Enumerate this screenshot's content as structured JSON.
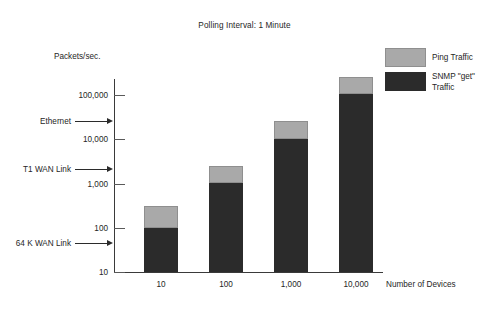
{
  "chart_data": {
    "type": "bar",
    "subtype": "stacked-bar",
    "title": "Polling Interval: 1 Minute",
    "xlabel": "Number of\nDevices",
    "ylabel": "Packets/sec.",
    "categories": [
      "10",
      "100",
      "1,000",
      "10,000"
    ],
    "yscale": "log",
    "ylim": [
      10,
      400000
    ],
    "ytick_labels": [
      "100,000",
      "10,000",
      "1,000",
      "100",
      "10"
    ],
    "ytick_values": [
      100000,
      10000,
      1000,
      100,
      10
    ],
    "grid": false,
    "legend_position": "top-right",
    "series": [
      {
        "name": "SNMP \"get\" Traffic",
        "color": "#2b2b2b",
        "values": [
          100,
          1000,
          10000,
          100000
        ]
      },
      {
        "name": "Ping Traffic",
        "color": "#a9a9a9",
        "values": [
          200,
          1500,
          15000,
          150000
        ]
      }
    ],
    "stack_totals": [
      300,
      2500,
      25000,
      250000
    ],
    "annotations": [
      {
        "label": "Ethernet",
        "value": 30000
      },
      {
        "label": "T1 WAN Link",
        "value": 2300
      },
      {
        "label": "64 K WAN Link",
        "value": 60
      }
    ]
  },
  "legend": {
    "entries": [
      {
        "label": "Ping Traffic",
        "color": "#a9a9a9"
      },
      {
        "label": "SNMP \"get\"\nTraffic",
        "color": "#2b2b2b"
      }
    ]
  }
}
